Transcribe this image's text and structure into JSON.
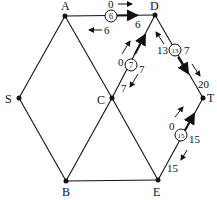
{
  "diagram": {
    "type": "flow-network",
    "nodes": [
      {
        "id": "A",
        "label": "A",
        "x": 65,
        "y": 16,
        "lx": 62,
        "ly": 10
      },
      {
        "id": "D",
        "label": "D",
        "x": 155,
        "y": 15,
        "lx": 151,
        "ly": 9
      },
      {
        "id": "S",
        "label": "S",
        "x": 19,
        "y": 98,
        "lx": 5,
        "ly": 104
      },
      {
        "id": "C",
        "label": "C",
        "x": 112,
        "y": 98,
        "lx": 97,
        "ly": 104
      },
      {
        "id": "T",
        "label": "T",
        "x": 203,
        "y": 98,
        "lx": 207,
        "ly": 102
      },
      {
        "id": "B",
        "label": "B",
        "x": 66,
        "y": 181,
        "lx": 62,
        "ly": 196
      },
      {
        "id": "E",
        "label": "E",
        "x": 158,
        "y": 180,
        "lx": 153,
        "ly": 196
      }
    ],
    "edges": [
      {
        "from": "A",
        "to": "D",
        "capacity": "6",
        "forward_label": "0",
        "backward_label": "6",
        "flow_label": "6"
      },
      {
        "from": "S",
        "to": "A"
      },
      {
        "from": "A",
        "to": "C"
      },
      {
        "from": "S",
        "to": "B"
      },
      {
        "from": "B",
        "to": "C"
      },
      {
        "from": "B",
        "to": "E"
      },
      {
        "from": "C",
        "to": "E"
      },
      {
        "from": "C",
        "to": "D",
        "capacity": "7",
        "forward_label": "0",
        "backward_label": "7",
        "flow_label": "7"
      },
      {
        "from": "D",
        "to": "T",
        "capacity": "13",
        "forward_label": "7",
        "backward_label": "13",
        "flow_label": "20"
      },
      {
        "from": "E",
        "to": "T",
        "capacity": "15",
        "forward_label": "0",
        "backward_label": "15",
        "flow_label": "15"
      }
    ],
    "labels": {
      "ad_top": "0",
      "ad_circle": "6",
      "ad_right": "6",
      "ad_bottom": "6",
      "cd_left": "0",
      "cd_circle": "7",
      "cd_right": "7",
      "cd_bottom": "7",
      "dt_left": "13",
      "dt_circle": "13",
      "dt_right": "7",
      "dt_bottom": "20",
      "et_left": "0",
      "et_circle": "15",
      "et_right": "15",
      "et_bottom": "15"
    },
    "colors": {
      "line": "#111111",
      "background": "#ffffff"
    }
  }
}
